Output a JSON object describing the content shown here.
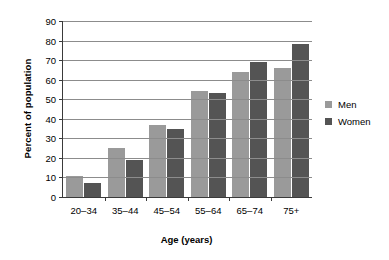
{
  "chart_data": {
    "type": "bar",
    "title": "",
    "xlabel": "Age (years)",
    "ylabel": "Percent of population",
    "categories": [
      "20–34",
      "35–44",
      "45–54",
      "55–64",
      "65–74",
      "75+"
    ],
    "series": [
      {
        "name": "Men",
        "color": "#9a9a9a",
        "values": [
          11,
          25,
          37,
          54,
          64,
          66
        ]
      },
      {
        "name": "Women",
        "color": "#545454",
        "values": [
          7,
          19,
          35,
          53,
          69,
          78
        ]
      }
    ],
    "ylim": [
      0,
      90
    ],
    "ytick_step": 10,
    "yticks": [
      0,
      10,
      20,
      30,
      40,
      50,
      60,
      70,
      80,
      90
    ],
    "ytick_labels": [
      "0",
      "10",
      "20",
      "30",
      "40",
      "50",
      "60",
      "70",
      "80",
      "90"
    ],
    "grid": true,
    "grid_axis": "y",
    "legend": true,
    "legend_position": "right",
    "legend_entries": [
      "Men",
      "Women"
    ]
  }
}
